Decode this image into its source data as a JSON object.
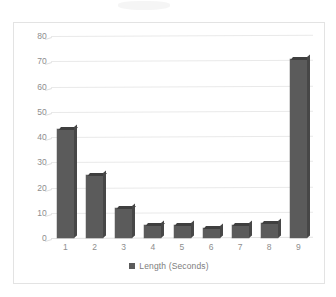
{
  "chart_data": {
    "type": "bar",
    "title": "",
    "subtitle": "",
    "xlabel": "",
    "ylabel": "",
    "categories": [
      "1",
      "2",
      "3",
      "4",
      "5",
      "6",
      "7",
      "8",
      "9"
    ],
    "values": [
      43,
      25,
      12,
      5,
      5,
      4,
      5,
      6,
      71
    ],
    "series": [
      {
        "name": "Length (Seconds)",
        "values": [
          43,
          25,
          12,
          5,
          5,
          4,
          5,
          6,
          71
        ],
        "color": "#5b5b5b"
      }
    ],
    "ylim": [
      0,
      80
    ],
    "ytick_labels": [
      "0",
      "10",
      "20",
      "30",
      "40",
      "50",
      "60",
      "70",
      "80"
    ],
    "ytick_values": [
      0,
      10,
      20,
      30,
      40,
      50,
      60,
      70,
      80
    ],
    "grid": true,
    "grid_axis": "y",
    "legend": {
      "position": "bottom",
      "entries": [
        {
          "label": "Length (Seconds)",
          "marker": "square-marker",
          "color": "#5b5b5b"
        }
      ]
    },
    "colors": {
      "bar": "#5b5b5b",
      "gridline": "#e9e9e9",
      "axis_text": "#8e8e8e",
      "legend_text": "#7d7d7d",
      "border": "#e3e3e3",
      "background": "#ffffff"
    }
  }
}
